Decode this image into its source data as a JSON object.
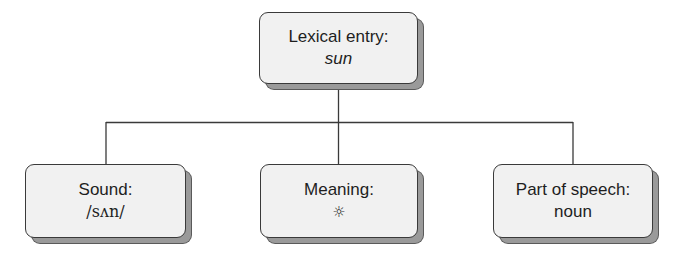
{
  "diagram": {
    "type": "tree",
    "root": {
      "label": "Lexical entry:",
      "value": "sun",
      "value_style": "italic"
    },
    "children": [
      {
        "label": "Sound:",
        "value": "/sʌn/"
      },
      {
        "label": "Meaning:",
        "value": "☼",
        "value_icon": "sun-icon"
      },
      {
        "label": "Part of speech:",
        "value": "noun"
      }
    ],
    "colors": {
      "box_fill": "#f1f1f1",
      "box_border": "#3a3a3a",
      "box_shadow": "#9a9a9a",
      "line": "#3a3a3a",
      "text": "#1e1e1e",
      "background": "#ffffff"
    }
  }
}
